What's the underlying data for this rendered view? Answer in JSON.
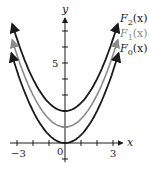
{
  "chart_data": {
    "type": "line",
    "title": "",
    "xlabel": "x",
    "ylabel": "y",
    "xlim": [
      -3.5,
      3.6
    ],
    "ylim": [
      -1,
      8
    ],
    "x_ticks": [
      -3,
      -2,
      -1,
      0,
      1,
      2,
      3
    ],
    "x_tick_labels": {
      "-3": "−3",
      "0": "0",
      "3": "3"
    },
    "y_ticks": [
      -1,
      1,
      2,
      3,
      4,
      5,
      6,
      7
    ],
    "y_tick_labels": {
      "5": "5"
    },
    "grid": false,
    "series": [
      {
        "name": "F2(x)",
        "label_main": "F",
        "label_sub": "2",
        "label_arg": "(x)",
        "offset": 2,
        "coef": 0.5,
        "color": "#1a1a1a",
        "x_range": [
          -3.3,
          3.3
        ]
      },
      {
        "name": "F1(x)",
        "label_main": "F",
        "label_sub": "1",
        "label_arg": "(x)",
        "offset": 1,
        "coef": 0.5,
        "color": "#8a8a8a",
        "x_range": [
          -3.3,
          3.3
        ]
      },
      {
        "name": "F0(x)",
        "label_main": "F",
        "label_sub": "0",
        "label_arg": "(x)",
        "offset": 0,
        "coef": 0.5,
        "color": "#1a1a1a",
        "x_range": [
          -3.35,
          3.35
        ]
      }
    ],
    "legend_position": "inline-right"
  },
  "labels": {
    "x_axis": "x",
    "y_axis": "y",
    "tick_neg3": "−3",
    "tick_0": "0",
    "tick_3": "3",
    "tick_5": "5"
  }
}
